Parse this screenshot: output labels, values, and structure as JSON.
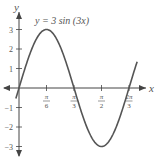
{
  "chart_data": {
    "type": "line",
    "title": "y = 3 sin (3x)",
    "function": "3*sin(3x)",
    "xlabel": "x",
    "ylabel": "y",
    "xlim": [
      0,
      2.0944
    ],
    "ylim": [
      -3,
      3
    ],
    "x_ticks": [
      {
        "value": 0.5236,
        "label_num": "π",
        "label_den": "6"
      },
      {
        "value": 1.0472,
        "label_num": "π",
        "label_den": "3"
      },
      {
        "value": 1.5708,
        "label_num": "π",
        "label_den": "2"
      },
      {
        "value": 2.0944,
        "label_num": "2π",
        "label_den": "3"
      }
    ],
    "y_ticks": [
      {
        "value": 3,
        "label": "3"
      },
      {
        "value": 2,
        "label": "2"
      },
      {
        "value": 1,
        "label": "1"
      },
      {
        "value": -1,
        "label": "-1"
      },
      {
        "value": -2,
        "label": "-2"
      },
      {
        "value": -3,
        "label": "-3"
      }
    ],
    "series": [
      {
        "name": "y = 3 sin (3x)",
        "x": [
          0,
          0.1745,
          0.3491,
          0.5236,
          0.6981,
          0.8727,
          1.0472,
          1.2217,
          1.3963,
          1.5708,
          1.7453,
          1.9199,
          2.0944
        ],
        "values": [
          0,
          1.5,
          2.598,
          3,
          2.598,
          1.5,
          0,
          -1.5,
          -2.598,
          -3,
          -2.598,
          -1.5,
          0
        ]
      }
    ],
    "grid": false,
    "legend": "none",
    "colors": {
      "curve": "#555555",
      "axes": "#444444",
      "text": "#555555"
    }
  },
  "labels": {
    "equation": "y = 3 sin (3x)",
    "x_axis": "x",
    "y_axis": "y"
  }
}
